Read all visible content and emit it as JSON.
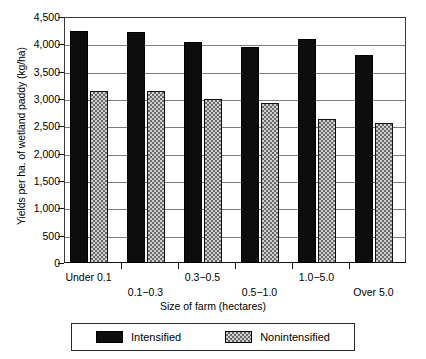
{
  "chart_data": {
    "type": "bar",
    "title": "",
    "xlabel": "Size of farm (hectares)",
    "ylabel": "Yields per ha. of wetland paddy (kg/ha)",
    "categories": [
      "Under 0.1",
      "0.1−0.3",
      "0.3−0.5",
      "0.5−1.0",
      "1.0−5.0",
      "Over 5.0"
    ],
    "series": [
      {
        "name": "Intensified",
        "color": "#0d0d0d",
        "pattern": "solid-black",
        "values": [
          4250,
          4220,
          4040,
          3950,
          4090,
          3800
        ]
      },
      {
        "name": "Nonintensified",
        "color": "#cfcfcf",
        "pattern": "checkered-gray",
        "values": [
          3150,
          3150,
          3000,
          2920,
          2640,
          2570
        ]
      }
    ],
    "ylim": [
      0,
      4500
    ],
    "ytick_values": [
      0,
      500,
      1000,
      1500,
      2000,
      2500,
      3000,
      3500,
      4000,
      4500
    ],
    "ytick_labels": [
      "0",
      "500",
      "1,000",
      "1,500",
      "2,000",
      "2,500",
      "3,000",
      "3,500",
      "4,000",
      "4,500"
    ],
    "grid": true,
    "grid_axis": "y",
    "legend_position": "bottom-center",
    "legend_entries": [
      "Intensified",
      "Nonintensified"
    ]
  },
  "axis": {
    "x_title": "Size of farm (hectares)",
    "y_title": "Yields per ha. of wetland paddy (kg/ha)"
  },
  "legend": {
    "intensified_label": "Intensified",
    "nonintensified_label": "Nonintensified"
  }
}
